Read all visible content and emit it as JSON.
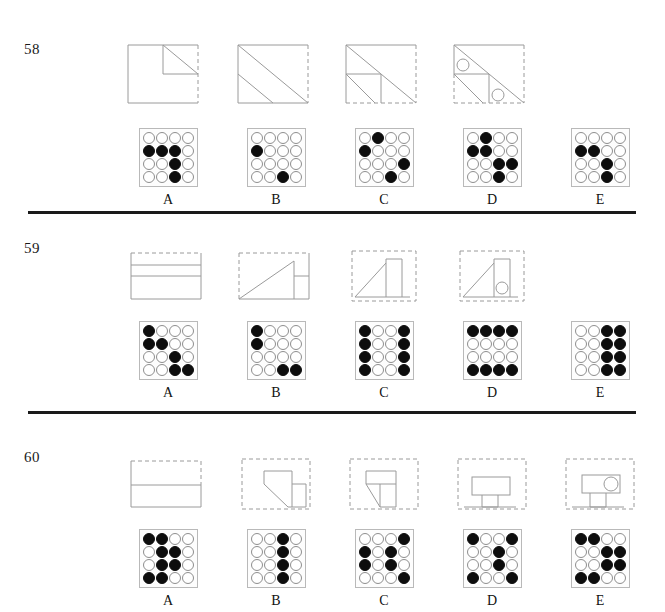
{
  "page": {
    "letters": [
      "A",
      "B",
      "C",
      "D",
      "E"
    ],
    "dot_filled_color": "#0d0d0d",
    "dot_empty_color": "#ffffff",
    "dot_outline_color": "#8e8e8e",
    "grid_border_color": "#b9b9b9",
    "line_color": "#9a9a9a",
    "divider_color": "#1a1a1a",
    "grid_rows": 4,
    "grid_cols": 4
  },
  "questions": [
    {
      "number": "58",
      "options": [
        {
          "letter": "A",
          "figure": "square-dashed-right-with-upper-right-triangle",
          "dots": [
            [
              0,
              0,
              0,
              0
            ],
            [
              1,
              1,
              1,
              0
            ],
            [
              0,
              0,
              1,
              0
            ],
            [
              0,
              0,
              1,
              0
            ]
          ]
        },
        {
          "letter": "B",
          "figure": "square-dashed-right-two-parallel-diagonals",
          "dots": [
            [
              0,
              0,
              0,
              0
            ],
            [
              1,
              0,
              0,
              0
            ],
            [
              0,
              0,
              0,
              0
            ],
            [
              0,
              0,
              1,
              0
            ]
          ]
        },
        {
          "letter": "C",
          "figure": "square-dashed-bottom-right-diagonal-with-inner-square",
          "dots": [
            [
              0,
              1,
              0,
              0
            ],
            [
              1,
              0,
              0,
              0
            ],
            [
              0,
              0,
              0,
              1
            ],
            [
              0,
              0,
              1,
              0
            ]
          ]
        },
        {
          "letter": "D",
          "figure": "square-dashed-bottom-right-diagonal-with-two-circles",
          "dots": [
            [
              0,
              1,
              0,
              0
            ],
            [
              1,
              1,
              0,
              0
            ],
            [
              0,
              0,
              1,
              1
            ],
            [
              0,
              0,
              1,
              0
            ]
          ]
        },
        {
          "letter": "E",
          "figure": "none",
          "dots": [
            [
              0,
              0,
              0,
              0
            ],
            [
              1,
              1,
              0,
              0
            ],
            [
              0,
              0,
              1,
              0
            ],
            [
              0,
              0,
              1,
              0
            ]
          ]
        }
      ]
    },
    {
      "number": "59",
      "options": [
        {
          "letter": "A",
          "figure": "rect-dashed-top-two-horizontal-lines",
          "dots": [
            [
              1,
              0,
              0,
              0
            ],
            [
              1,
              1,
              0,
              0
            ],
            [
              0,
              0,
              1,
              0
            ],
            [
              0,
              0,
              1,
              1
            ]
          ]
        },
        {
          "letter": "B",
          "figure": "rect-dashed-top-left-rising-diagonal-with-right-cell",
          "dots": [
            [
              1,
              0,
              0,
              0
            ],
            [
              1,
              0,
              0,
              0
            ],
            [
              0,
              0,
              0,
              0
            ],
            [
              0,
              0,
              1,
              1
            ]
          ]
        },
        {
          "letter": "C",
          "figure": "dashed-box-rising-diagonal-with-vertical-bar",
          "dots": [
            [
              1,
              0,
              0,
              1
            ],
            [
              1,
              0,
              0,
              1
            ],
            [
              1,
              0,
              0,
              1
            ],
            [
              1,
              0,
              0,
              1
            ]
          ]
        },
        {
          "letter": "D",
          "figure": "dashed-box-rising-diagonal-vertical-bar-and-circle",
          "dots": [
            [
              1,
              1,
              1,
              1
            ],
            [
              0,
              0,
              0,
              0
            ],
            [
              0,
              0,
              0,
              0
            ],
            [
              1,
              1,
              1,
              1
            ]
          ]
        },
        {
          "letter": "E",
          "figure": "none",
          "dots": [
            [
              0,
              0,
              1,
              1
            ],
            [
              0,
              0,
              1,
              1
            ],
            [
              0,
              0,
              1,
              1
            ],
            [
              0,
              0,
              1,
              1
            ]
          ]
        }
      ]
    },
    {
      "number": "60",
      "options": [
        {
          "letter": "A",
          "figure": "rect-dashed-top-right-one-horizontal-line",
          "dots": [
            [
              1,
              1,
              0,
              0
            ],
            [
              0,
              1,
              1,
              0
            ],
            [
              0,
              1,
              1,
              0
            ],
            [
              1,
              1,
              0,
              0
            ]
          ]
        },
        {
          "letter": "B",
          "figure": "dashed-box-with-chamfered-block-and-side-cell",
          "dots": [
            [
              0,
              0,
              1,
              0
            ],
            [
              0,
              0,
              1,
              0
            ],
            [
              0,
              0,
              1,
              0
            ],
            [
              0,
              0,
              1,
              0
            ]
          ]
        },
        {
          "letter": "C",
          "figure": "dashed-box-with-chamfered-block-and-stem",
          "dots": [
            [
              0,
              0,
              0,
              1
            ],
            [
              1,
              0,
              1,
              0
            ],
            [
              1,
              0,
              1,
              0
            ],
            [
              0,
              0,
              0,
              1
            ]
          ]
        },
        {
          "letter": "D",
          "figure": "dashed-box-with-rect-block-and-stem",
          "dots": [
            [
              1,
              0,
              0,
              1
            ],
            [
              0,
              0,
              1,
              0
            ],
            [
              0,
              0,
              1,
              0
            ],
            [
              1,
              0,
              0,
              1
            ]
          ]
        },
        {
          "letter": "E",
          "figure": "dashed-box-with-rect-block-circle-and-stem",
          "dots": [
            [
              1,
              1,
              0,
              0
            ],
            [
              0,
              0,
              1,
              1
            ],
            [
              0,
              0,
              1,
              1
            ],
            [
              1,
              1,
              0,
              0
            ]
          ]
        }
      ]
    }
  ]
}
